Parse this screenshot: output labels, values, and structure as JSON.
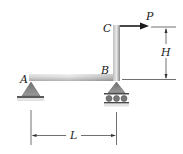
{
  "figure": {
    "type": "structural-frame",
    "points": {
      "A": "A",
      "B": "B",
      "C": "C"
    },
    "load": {
      "label": "P",
      "direction": "right"
    },
    "dimensions": {
      "horizontal": {
        "label": "L",
        "between": "A-B"
      },
      "vertical": {
        "label": "H",
        "between": "B-C"
      }
    },
    "supports": {
      "A": "pin",
      "B": "roller"
    },
    "colors": {
      "beam_light": "#e6e6e6",
      "beam_dark": "#8c8c8c",
      "support": "#7a7a7a",
      "line": "#333333",
      "arrow": "#1a1a1a"
    }
  }
}
